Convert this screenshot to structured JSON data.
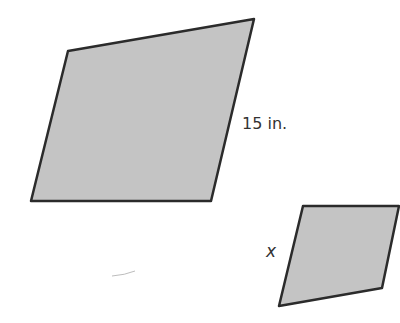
{
  "figure": {
    "shape_fill": "#c4c4c4",
    "stroke_color": "#2b2b2b",
    "large_shape": {
      "side_label": "15 in.",
      "points": "68,51 254,19 211,201 31,201"
    },
    "small_shape": {
      "side_label": "x",
      "points": "303,206 399,206 382,288 279,306"
    }
  }
}
